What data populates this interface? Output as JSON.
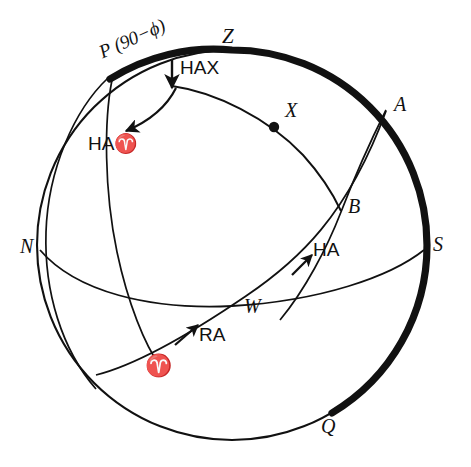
{
  "figure": {
    "type": "celestial-sphere-diagram",
    "background_color": "#ffffff",
    "ink_color": "#111111",
    "circle": {
      "cx": 232,
      "cy": 245,
      "r": 195
    }
  },
  "labels": {
    "p_pole": "P (90−ϕ)",
    "zenith": "Z",
    "ha_x": "HAX",
    "ha_aries": "HA♈",
    "star_x": "X",
    "point_a": "A",
    "point_b": "B",
    "north": "N",
    "south": "S",
    "west": "W",
    "ha": "HA",
    "ra": "RA",
    "aries": "♈",
    "point_q": "Q"
  },
  "glyphs": {
    "aries_symbol": "♈",
    "phi_symbol": "ϕ"
  },
  "markers": {
    "star_point": "filled-dot",
    "ha_x_arrow": "down-arrow",
    "ha_aries_arrow": "curved-arrow-down-left",
    "ha_arrow": "arrow-up-right",
    "ra_arrow": "arrow-up-right"
  },
  "style": {
    "thick_arc_width": 7,
    "thin_arc_width": 1.6,
    "label_font_size": 19
  }
}
